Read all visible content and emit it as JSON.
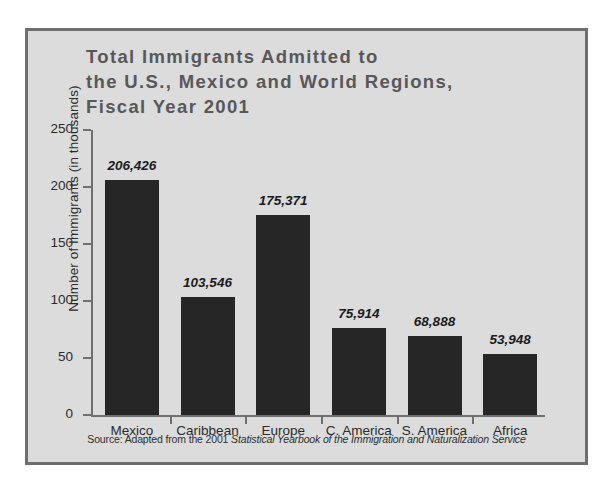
{
  "figure": {
    "title": "Total Immigrants Admitted to\nthe U.S., Mexico and World Regions,\nFiscal Year 2001",
    "background_color": "#dcdcdc",
    "border_color": "#6e6e6e",
    "bar_color": "#262626",
    "axis_color": "#6f6f6f",
    "title_color": "#58585a"
  },
  "source_note": {
    "prefix": "Source: Adapted from the 2001 ",
    "italic_part": "Statistical Yearbook of the Immigration and Naturalization Service"
  },
  "chart_data": {
    "type": "bar",
    "title": "Total Immigrants Admitted to the U.S., Mexico and World Regions, Fiscal Year 2001",
    "xlabel": "",
    "ylabel": "Number of Immigrants (in thousands)",
    "ylim": [
      0,
      250
    ],
    "yticks": [
      0,
      50,
      100,
      150,
      200,
      250
    ],
    "ytick_labels": [
      "0",
      "50",
      "100",
      "150",
      "200",
      "250"
    ],
    "grid": false,
    "legend": false,
    "categories": [
      "Mexico",
      "Caribbean",
      "Europe",
      "C. America",
      "S. America",
      "Africa"
    ],
    "values": [
      206.426,
      103.546,
      175.371,
      75.914,
      68.888,
      53.948
    ],
    "data_labels": [
      "206,426",
      "103,546",
      "175,371",
      "75,914",
      "68,888",
      "53,948"
    ]
  }
}
